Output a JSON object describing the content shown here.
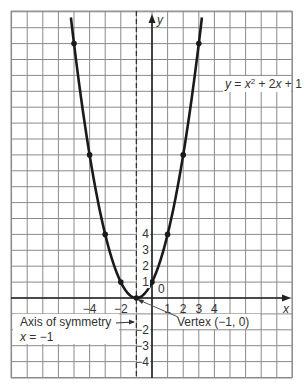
{
  "chart_data": {
    "type": "line",
    "title": "",
    "equation_label": "y = x² + 2x + 1",
    "xlabel": "x",
    "ylabel": "y",
    "xlim": [
      -9,
      9
    ],
    "ylim": [
      -5,
      18
    ],
    "grid": true,
    "x_ticks": [
      {
        "value": -4,
        "label": "−4"
      },
      {
        "value": -2,
        "label": "−2"
      },
      {
        "value": 1,
        "label": "1"
      },
      {
        "value": 2,
        "label": "2"
      },
      {
        "value": 3,
        "label": "3"
      },
      {
        "value": 4,
        "label": "4"
      }
    ],
    "y_ticks": [
      {
        "value": 4,
        "label": "4"
      },
      {
        "value": 3,
        "label": "3"
      },
      {
        "value": 2,
        "label": "2"
      },
      {
        "value": 1,
        "label": "1"
      },
      {
        "value": -2,
        "label": "−2"
      },
      {
        "value": -3,
        "label": "−3"
      },
      {
        "value": -4,
        "label": "−4"
      }
    ],
    "origin_label": "0",
    "series": [
      {
        "name": "y = x² + 2x + 1",
        "x": [
          -5,
          -4,
          -3,
          -2,
          -1,
          0,
          1,
          2,
          3
        ],
        "y": [
          16,
          9,
          4,
          1,
          0,
          1,
          4,
          9,
          16
        ]
      }
    ],
    "annotations": {
      "axis_of_symmetry_line1": "Axis of symmetry",
      "axis_of_symmetry_line2": "x = −1",
      "vertex": "Vertex (−1, 0)"
    }
  }
}
